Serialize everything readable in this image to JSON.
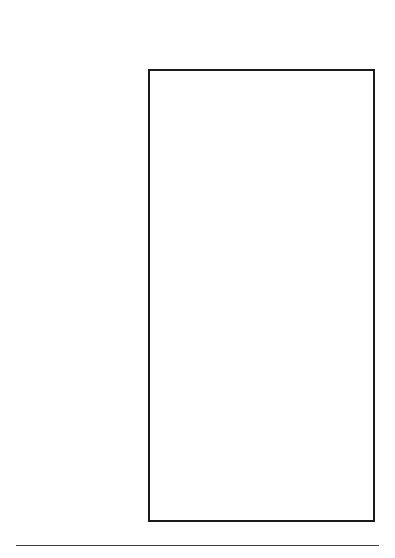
{
  "chart_data": {
    "type": "bar",
    "orientation": "horizontal",
    "xlabel": "",
    "ylabel": "",
    "xlim": [
      0,
      173
    ],
    "xticks": [
      0,
      50,
      100,
      150
    ],
    "xtick_labels": [
      "0",
      "50",
      "100",
      "150"
    ],
    "xminorticks": [
      25,
      75,
      125
    ],
    "grid": false,
    "legend": null,
    "axis_tick_label_rotation": -90,
    "groups": [
      {
        "name": "fish",
        "items": [
          {
            "label": "Baked Haddock",
            "value": 65
          },
          {
            "label": "Pink Salmon",
            "value": 43
          },
          {
            "label": "Swordfish",
            "value": 43
          },
          {
            "label": "Tuna in Oil",
            "value": 16
          },
          {
            "label": "Tuna in Water",
            "value": 16
          }
        ]
      },
      {
        "name": "shellfish",
        "items": [
          {
            "label": "Crab",
            "value": 86
          },
          {
            "label": "Lobster",
            "value": 61
          },
          {
            "label": "Fresh Shrimp",
            "value": 158
          },
          {
            "label": "Raw Clams",
            "value": 30
          },
          {
            "label": "Raw Oysters",
            "value": 49
          }
        ]
      },
      {
        "name": "meat",
        "items": [
          {
            "label": "Regular Ground Beef",
            "value": 79
          },
          {
            "label": "Lean Rib Roast",
            "value": 72
          },
          {
            "label": "Lean Bottom Round",
            "value": 83
          },
          {
            "label": "Lean Roast Ham",
            "value": 53
          },
          {
            "label": "Lean Veal Cutlet",
            "value": 83
          }
        ]
      },
      {
        "name": "poultry",
        "items": [
          {
            "label": "Skinless Chicken Breast",
            "value": 74
          },
          {
            "label": "Fried Chicken Breast",
            "value": 76
          },
          {
            "label": "Skinless Chicken Leg",
            "value": 79
          },
          {
            "label": "Fried Chicken Leg",
            "value": 83
          },
          {
            "label": "Skinless Turkey Breast",
            "value": 55
          }
        ]
      }
    ],
    "categories": [
      "Baked Haddock",
      "Pink Salmon",
      "Swordfish",
      "Tuna in Oil",
      "Tuna in Water",
      "Crab",
      "Lobster",
      "Fresh Shrimp",
      "Raw Clams",
      "Raw Oysters",
      "Regular Ground Beef",
      "Lean Rib Roast",
      "Lean Bottom Round",
      "Lean Roast Ham",
      "Lean Veal Cutlet",
      "Skinless Chicken Breast",
      "Fried Chicken Breast",
      "Skinless Chicken Leg",
      "Fried Chicken Leg",
      "Skinless Turkey Breast"
    ],
    "values": [
      65,
      43,
      43,
      16,
      16,
      86,
      61,
      158,
      30,
      49,
      79,
      72,
      83,
      53,
      83,
      74,
      76,
      79,
      83,
      55
    ],
    "colors": {
      "bar_fill": "#8c8c8c",
      "bar_hatch": "#2e2e2e",
      "bar_edge": "#3a3a3a",
      "axis": "#1a1a1a",
      "background": "#ffffff",
      "text": "#000000"
    }
  }
}
